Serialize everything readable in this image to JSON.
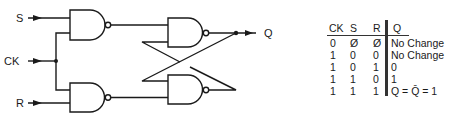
{
  "diagram": {
    "inputs": [
      {
        "label": "S"
      },
      {
        "label": "CK"
      },
      {
        "label": "R"
      }
    ],
    "output": {
      "label": "Q"
    },
    "gates": [
      {
        "type": "NAND",
        "name": "input-gate-s"
      },
      {
        "type": "NAND",
        "name": "input-gate-r"
      },
      {
        "type": "NAND",
        "name": "latch-gate-top"
      },
      {
        "type": "NAND",
        "name": "latch-gate-bottom"
      }
    ],
    "colors": {
      "line": "#1a1a1a",
      "background": "#ffffff"
    }
  },
  "truth_table": {
    "headers": {
      "ck": "CK",
      "s": "S",
      "r": "R",
      "q": "Q"
    },
    "rows": [
      {
        "ck": "0",
        "s": "Ø",
        "r": "Ø",
        "q": "No Change"
      },
      {
        "ck": "1",
        "s": "0",
        "r": "0",
        "q": "No Change"
      },
      {
        "ck": "1",
        "s": "0",
        "r": "1",
        "q": "0"
      },
      {
        "ck": "1",
        "s": "1",
        "r": "0",
        "q": "1"
      },
      {
        "ck": "1",
        "s": "1",
        "r": "1",
        "q": "Q = Q̄ = 1"
      }
    ]
  }
}
